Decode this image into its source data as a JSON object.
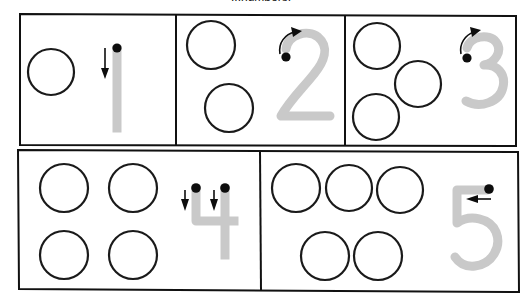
{
  "worksheet": {
    "caption": "...numbers.",
    "caption_visible": "partially cut off at top edge",
    "ink_color": "#111111",
    "numeral_color": "#c9c9c9",
    "marker_color": "#0d0d0d",
    "background": "#ffffff",
    "layout": "two rows: 3 cells on top, 2 cells on bottom"
  },
  "cells": [
    {
      "id": "cell-1",
      "numeral": "1",
      "count": 1,
      "count_label": "1",
      "circles": 1,
      "start_dots": 1,
      "arrows": [
        {
          "name": "arrow-down",
          "direction": "down",
          "glyph": "↓"
        }
      ]
    },
    {
      "id": "cell-2",
      "numeral": "2",
      "count": 2,
      "count_label": "2",
      "circles": 2,
      "start_dots": 1,
      "arrows": [
        {
          "name": "arrow-curve-up-right",
          "direction": "curve-up-right",
          "glyph": "↱"
        }
      ]
    },
    {
      "id": "cell-3",
      "numeral": "3",
      "count": 3,
      "count_label": "3",
      "circles": 3,
      "start_dots": 1,
      "arrows": [
        {
          "name": "arrow-curve-up-right",
          "direction": "curve-up-right",
          "glyph": "↱"
        }
      ]
    },
    {
      "id": "cell-4",
      "numeral": "4",
      "count": 4,
      "count_label": "4",
      "circles": 4,
      "start_dots": 2,
      "arrows": [
        {
          "name": "arrow-down-left",
          "direction": "down",
          "glyph": "↓"
        },
        {
          "name": "arrow-down-right",
          "direction": "down",
          "glyph": "↓"
        }
      ]
    },
    {
      "id": "cell-5",
      "numeral": "5",
      "count": 5,
      "count_label": "5",
      "circles": 5,
      "start_dots": 1,
      "arrows": [
        {
          "name": "arrow-left",
          "direction": "left",
          "glyph": "←"
        }
      ]
    }
  ]
}
